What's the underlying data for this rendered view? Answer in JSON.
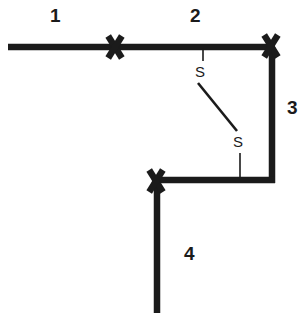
{
  "figure": {
    "type": "line-diagram",
    "background_color": "#ffffff",
    "stroke_color": "#1b1b1b"
  },
  "segment_labels": [
    {
      "text": "1",
      "x": 50,
      "y": 6
    },
    {
      "text": "2",
      "x": 190,
      "y": 6
    },
    {
      "text": "3",
      "x": 287,
      "y": 98
    },
    {
      "text": "4",
      "x": 184,
      "y": 244
    }
  ],
  "switch_labels": [
    {
      "text": "S",
      "x": 195,
      "y": 64
    },
    {
      "text": "S",
      "x": 233,
      "y": 134
    }
  ],
  "cross_marks": [
    {
      "name": "cross-mark-left",
      "cx": 115,
      "cy": 47
    },
    {
      "name": "cross-mark-corner-top-right",
      "cx": 271,
      "cy": 46
    },
    {
      "name": "cross-mark-corner-bottom-left",
      "cx": 156,
      "cy": 181
    }
  ],
  "thick_lines": [
    {
      "name": "conductor-horizontal-top",
      "x1": 8,
      "y1": 47,
      "x2": 275,
      "y2": 47
    },
    {
      "name": "conductor-vertical-right",
      "x1": 272,
      "y1": 47,
      "x2": 272,
      "y2": 183
    },
    {
      "name": "conductor-horizontal-bottom",
      "x1": 152,
      "y1": 180,
      "x2": 275,
      "y2": 180
    },
    {
      "name": "conductor-vertical-bottom",
      "x1": 157,
      "y1": 181,
      "x2": 157,
      "y2": 313
    }
  ],
  "thin_lines": [
    {
      "name": "switch-lead-upper",
      "x1": 203,
      "y1": 48,
      "x2": 203,
      "y2": 61
    },
    {
      "name": "switch-blade",
      "x1": 198,
      "y1": 83,
      "x2": 237,
      "y2": 131
    },
    {
      "name": "switch-lead-lower",
      "x1": 240,
      "y1": 153,
      "x2": 240,
      "y2": 180
    }
  ]
}
